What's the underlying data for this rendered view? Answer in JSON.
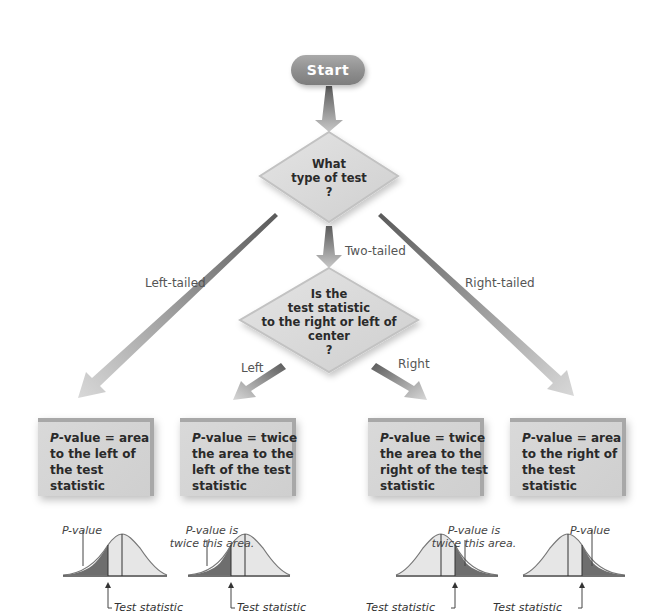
{
  "flowchart": {
    "start": {
      "label": "Start"
    },
    "decision1": {
      "lines": [
        "What",
        "type of test",
        "?"
      ]
    },
    "decision2": {
      "lines": [
        "Is the",
        "test statistic",
        "to the right or left of",
        "center",
        "?"
      ]
    },
    "branches": {
      "left_tailed": "Left-tailed",
      "two_tailed": "Two-tailed",
      "right_tailed": "Right-tailed",
      "left": "Left",
      "right": "Right"
    },
    "results": [
      {
        "p": "P",
        "lines": [
          "-value = area",
          "to the left of",
          "the test",
          "statistic"
        ]
      },
      {
        "p": "P",
        "lines": [
          "-value = twice",
          "the area to the",
          "left of the test",
          "statistic"
        ]
      },
      {
        "p": "P",
        "lines": [
          "-value = twice",
          "the area to the",
          "right of the test",
          "statistic"
        ]
      },
      {
        "p": "P",
        "lines": [
          "-value = area",
          "to the right of",
          "the test",
          "statistic"
        ]
      }
    ],
    "curves": [
      {
        "annotation": [
          "P-value"
        ],
        "test_statistic": "Test statistic",
        "shade": "left"
      },
      {
        "annotation": [
          "P-value is",
          "twice this area."
        ],
        "test_statistic": "Test statistic",
        "shade": "left"
      },
      {
        "annotation": [
          "P-value is",
          "twice this area."
        ],
        "test_statistic": "Test statistic",
        "shade": "right"
      },
      {
        "annotation": [
          "P-value"
        ],
        "test_statistic": "Test statistic",
        "shade": "right"
      }
    ]
  },
  "colors": {
    "box_fill": "#d4d4d4",
    "box_edge": "#a8a8a8",
    "arrow": "#9a9a9a",
    "shade_dark": "#6e6e6e",
    "shade_light": "#e6e6e6",
    "start_fill": "#959595"
  }
}
